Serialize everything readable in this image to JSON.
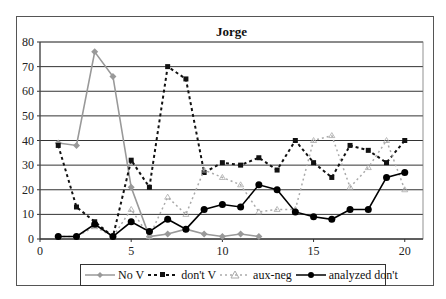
{
  "chart_data": {
    "type": "line",
    "title": "Jorge",
    "xlabel": "",
    "ylabel": "",
    "xlim": [
      0,
      21
    ],
    "ylim": [
      0,
      80
    ],
    "x_ticks": [
      "0",
      "5",
      "10",
      "15",
      "20"
    ],
    "y_ticks": [
      "0",
      "10",
      "20",
      "30",
      "40",
      "50",
      "60",
      "70",
      "80"
    ],
    "grid": "horizontal",
    "legend_position": "bottom",
    "x": [
      1,
      2,
      3,
      4,
      5,
      6,
      7,
      8,
      9,
      10,
      11,
      12,
      13,
      14,
      15,
      16,
      17,
      18,
      19,
      20
    ],
    "series": [
      {
        "name": "No V",
        "style": "solid",
        "color": "#999999",
        "marker": "diamond",
        "x": [
          1,
          2,
          3,
          4,
          5,
          6,
          7,
          8,
          9,
          10,
          11,
          12
        ],
        "values": [
          39,
          38,
          76,
          66,
          21,
          1,
          2,
          4,
          2,
          1,
          2,
          1
        ]
      },
      {
        "name": "don't V",
        "style": "dashed",
        "color": "#111111",
        "marker": "square",
        "x": [
          1,
          2,
          3,
          4,
          5,
          6,
          7,
          8,
          9,
          10,
          11,
          12,
          13,
          14,
          15,
          16,
          17,
          18,
          19,
          20
        ],
        "values": [
          38,
          13,
          7,
          1,
          32,
          21,
          70,
          65,
          27,
          31,
          30,
          33,
          28,
          40,
          31,
          25,
          38,
          36,
          31,
          40
        ]
      },
      {
        "name": "aux-neg",
        "style": "dotted",
        "color": "#aaaaaa",
        "marker": "triangle",
        "x": [
          1,
          2,
          3,
          4,
          5,
          6,
          7,
          8,
          9,
          10,
          11,
          12,
          13,
          14,
          15,
          16,
          17,
          18,
          19,
          20
        ],
        "values": [
          1,
          1,
          5,
          1,
          12,
          1,
          17,
          10,
          28,
          25,
          22,
          11,
          12,
          12,
          40,
          42,
          21,
          29,
          40,
          20
        ]
      },
      {
        "name": "analyzed don't",
        "style": "solid",
        "color": "#000000",
        "marker": "circle",
        "x": [
          1,
          2,
          3,
          4,
          5,
          6,
          7,
          8,
          9,
          10,
          11,
          12,
          13,
          14,
          15,
          16,
          17,
          18,
          19,
          20
        ],
        "values": [
          1,
          1,
          6,
          1,
          7,
          3,
          8,
          4,
          12,
          14,
          13,
          22,
          20,
          11,
          9,
          8,
          12,
          12,
          25,
          27
        ]
      }
    ]
  },
  "legend": {
    "items": [
      "No V",
      "don't V",
      "aux-neg",
      "analyzed don't"
    ]
  }
}
